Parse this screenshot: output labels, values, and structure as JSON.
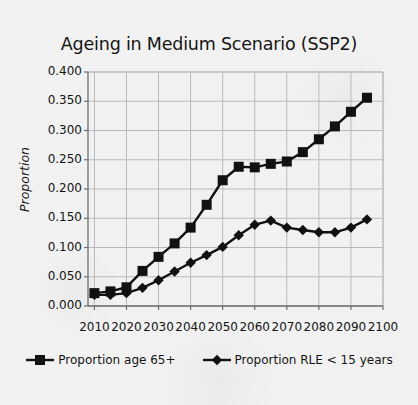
{
  "figure": {
    "background_color": "#f3f3f3",
    "ink_color": "#111111",
    "grid_color": "#b9b9b9",
    "axis_color": "#6e6e6e"
  },
  "chart_data": {
    "type": "line",
    "title": "Ageing in Medium Scenario (SSP2)",
    "xlabel": "",
    "ylabel": "Proportion",
    "xlim": [
      2008,
      2100
    ],
    "ylim": [
      0.0,
      0.4
    ],
    "grid": true,
    "legend_position": "bottom",
    "x_tick_labels": [
      "2010",
      "2020",
      "2030",
      "2040",
      "2050",
      "2060",
      "2070",
      "2080",
      "2090",
      "2100"
    ],
    "x_ticks": [
      2010,
      2020,
      2030,
      2040,
      2050,
      2060,
      2070,
      2080,
      2090,
      2100
    ],
    "y_tick_labels": [
      "0.400",
      "0.350",
      "0.300",
      "0.250",
      "0.200",
      "0.150",
      "0.100",
      "0.050",
      "0.000"
    ],
    "y_ticks": [
      0.4,
      0.35,
      0.3,
      0.25,
      0.2,
      0.15,
      0.1,
      0.05,
      0.0
    ],
    "x": [
      2010,
      2015,
      2020,
      2025,
      2030,
      2035,
      2040,
      2045,
      2050,
      2055,
      2060,
      2065,
      2070,
      2075,
      2080,
      2085,
      2090,
      2095
    ],
    "series": [
      {
        "name": "Proportion age 65+",
        "marker": "square",
        "color": "#111111",
        "values": [
          0.022,
          0.025,
          0.032,
          0.06,
          0.084,
          0.107,
          0.134,
          0.173,
          0.215,
          0.238,
          0.237,
          0.243,
          0.247,
          0.263,
          0.285,
          0.307,
          0.332,
          0.356
        ]
      },
      {
        "name": "Proportion RLE < 15 years",
        "marker": "diamond",
        "color": "#111111",
        "values": [
          0.019,
          0.019,
          0.022,
          0.031,
          0.044,
          0.059,
          0.074,
          0.087,
          0.101,
          0.121,
          0.139,
          0.146,
          0.134,
          0.13,
          0.126,
          0.126,
          0.134,
          0.148
        ]
      }
    ]
  },
  "legend": {
    "items": [
      {
        "label": "Proportion age 65+",
        "marker": "square-marker"
      },
      {
        "label": "Proportion RLE < 15 years",
        "marker": "diamond-marker"
      }
    ]
  }
}
